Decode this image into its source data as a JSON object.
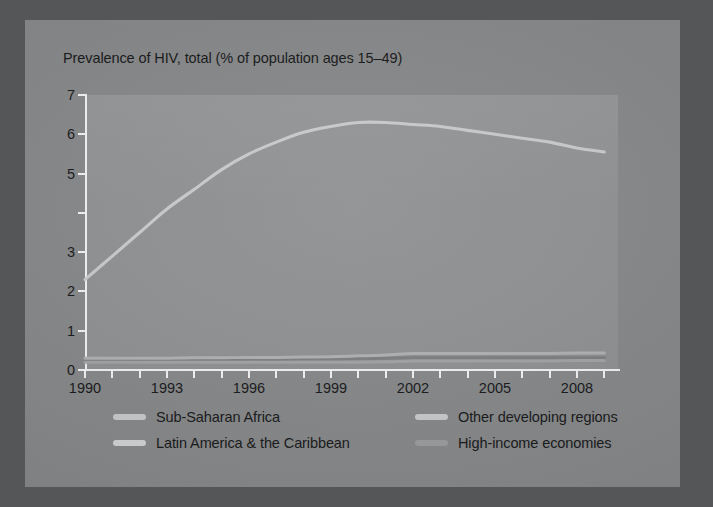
{
  "figure": {
    "frame_color": "#555657",
    "card_color": "#878889",
    "plot_bg_color": "#909192",
    "axis_color": "#f2f2f2",
    "text_color": "#18191b"
  },
  "chart_data": {
    "type": "line",
    "title": "Prevalence of HIV, total (% of population ages 15–49)",
    "xlabel": "",
    "ylabel": "",
    "xlim": [
      1990,
      2009.5
    ],
    "ylim": [
      0,
      7
    ],
    "ytick_values": [
      0,
      1,
      2,
      3,
      5,
      6,
      7
    ],
    "ytick_labels": [
      "0",
      "1",
      "2",
      "3",
      "5",
      "6",
      "7"
    ],
    "ytick_all_positions": [
      0,
      1,
      2,
      3,
      4,
      5,
      6,
      7
    ],
    "ytick_note": "tick mark present at 4 but its label is not printed",
    "xtick_years": [
      1990,
      1991,
      1992,
      1993,
      1994,
      1995,
      1996,
      1997,
      1998,
      1999,
      2000,
      2001,
      2002,
      2003,
      2004,
      2005,
      2006,
      2007,
      2008,
      2009
    ],
    "xtick_labels": [
      "1990",
      "",
      "",
      "1993",
      "",
      "",
      "1996",
      "",
      "",
      "1999",
      "",
      "",
      "2002",
      "",
      "",
      "2005",
      "",
      "",
      "2008",
      ""
    ],
    "xtick_labeled_years": [
      1990,
      1993,
      1996,
      1999,
      2002,
      2005,
      2008
    ],
    "grid": false,
    "legend_position": "below-plot",
    "x": [
      1990,
      1991,
      1992,
      1993,
      1994,
      1995,
      1996,
      1997,
      1998,
      1999,
      2000,
      2001,
      2002,
      2003,
      2004,
      2005,
      2006,
      2007,
      2008,
      2009
    ],
    "series": [
      {
        "name": "Sub-Saharan Africa",
        "color": "#c9cacb",
        "values": [
          2.3,
          2.9,
          3.5,
          4.1,
          4.6,
          5.1,
          5.5,
          5.8,
          6.05,
          6.2,
          6.3,
          6.3,
          6.25,
          6.2,
          6.1,
          6.0,
          5.9,
          5.8,
          5.65,
          5.55
        ]
      },
      {
        "name": "Other developing regions",
        "color": "#b0b1b2",
        "values": [
          0.3,
          0.3,
          0.3,
          0.3,
          0.31,
          0.31,
          0.32,
          0.32,
          0.33,
          0.34,
          0.36,
          0.38,
          0.42,
          0.42,
          0.42,
          0.42,
          0.42,
          0.42,
          0.43,
          0.43
        ]
      },
      {
        "name": "Latin America & the Caribbean",
        "color": "#7e7f80",
        "values": [
          0.24,
          0.24,
          0.25,
          0.25,
          0.26,
          0.26,
          0.27,
          0.27,
          0.28,
          0.28,
          0.29,
          0.3,
          0.31,
          0.31,
          0.31,
          0.31,
          0.31,
          0.31,
          0.31,
          0.31
        ]
      },
      {
        "name": "High-income economies",
        "color": "#a2a3a4",
        "values": [
          0.2,
          0.2,
          0.2,
          0.2,
          0.2,
          0.2,
          0.2,
          0.2,
          0.2,
          0.2,
          0.2,
          0.21,
          0.23,
          0.23,
          0.23,
          0.23,
          0.23,
          0.23,
          0.24,
          0.24
        ]
      }
    ]
  },
  "legend": {
    "items": [
      {
        "label": "Sub-Saharan Africa",
        "swatch": "#c9cacb"
      },
      {
        "label": "Other developing regions",
        "swatch": "#c9cacb"
      },
      {
        "label": "Latin America & the Caribbean",
        "swatch": "#d2d3d4"
      },
      {
        "label": "High-income economies",
        "swatch": "#9b9c9d"
      }
    ]
  }
}
